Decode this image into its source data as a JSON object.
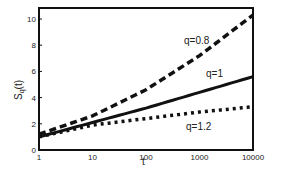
{
  "chart_data": {
    "type": "line",
    "title": "",
    "xlabel": "t",
    "ylabel": "S_q(t)",
    "xscale": "log",
    "xlim": [
      1,
      10000
    ],
    "ylim": [
      0,
      11
    ],
    "xticks": [
      "1",
      "10",
      "100",
      "1000",
      "10000"
    ],
    "yticks": [
      "0",
      "2",
      "4",
      "6",
      "8",
      "10"
    ],
    "grid": false,
    "x": [
      1,
      10,
      100,
      1000,
      10000
    ],
    "series": [
      {
        "name": "q=0.8",
        "style": "dashed",
        "values": [
          1.2,
          2.6,
          4.6,
          7.2,
          10.3
        ]
      },
      {
        "name": "q=1",
        "style": "solid",
        "values": [
          1.0,
          2.1,
          3.2,
          4.4,
          5.6
        ]
      },
      {
        "name": "q=1.2",
        "style": "dotted",
        "values": [
          1.0,
          1.9,
          2.4,
          2.9,
          3.3
        ]
      }
    ]
  },
  "labels": {
    "q08": "q=0.8",
    "q1": "q=1",
    "q12": "q=1.2",
    "x": "t",
    "y": "S",
    "ysub": "q",
    "yrest": "(t)"
  }
}
